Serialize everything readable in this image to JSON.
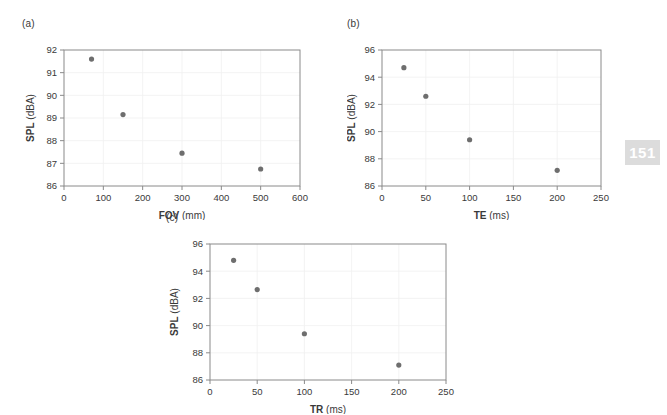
{
  "page_number": "151",
  "page_number_bg": "#dcdcdc",
  "marker_color": "#6e6e6e",
  "frame_color": "#8a8a8a",
  "grid_color": "#f0f0f0",
  "chart_data": [
    {
      "type": "scatter",
      "panel_label": "(a)",
      "title": "",
      "xlabel_bold": "FOV",
      "xlabel_unit": "(mm)",
      "ylabel_bold": "SPL",
      "ylabel_unit": "(dBA)",
      "xlim": [
        0,
        600
      ],
      "ylim": [
        86,
        92
      ],
      "xticks": [
        0,
        100,
        200,
        300,
        400,
        500,
        600
      ],
      "yticks": [
        86,
        87,
        88,
        89,
        90,
        91,
        92
      ],
      "xticklabels": [
        "0",
        "100",
        "200",
        "300",
        "400",
        "500",
        "600"
      ],
      "yticklabels": [
        "86",
        "87",
        "88",
        "89",
        "90",
        "91",
        "92"
      ],
      "grid": true,
      "legend": "none",
      "x": [
        70,
        150,
        300,
        500
      ],
      "y": [
        91.6,
        89.15,
        87.45,
        86.75
      ]
    },
    {
      "type": "scatter",
      "panel_label": "(b)",
      "title": "",
      "xlabel_bold": "TE",
      "xlabel_unit": "(ms)",
      "ylabel_bold": "SPL",
      "ylabel_unit": "(dBA)",
      "xlim": [
        0,
        250
      ],
      "ylim": [
        86,
        96
      ],
      "xticks": [
        0,
        50,
        100,
        150,
        200,
        250
      ],
      "yticks": [
        86,
        88,
        90,
        92,
        94,
        96
      ],
      "xticklabels": [
        "0",
        "50",
        "100",
        "150",
        "200",
        "250"
      ],
      "yticklabels": [
        "86",
        "88",
        "90",
        "92",
        "94",
        "96"
      ],
      "grid": true,
      "legend": "none",
      "x": [
        25,
        50,
        100,
        200
      ],
      "y": [
        94.7,
        92.6,
        89.4,
        87.15
      ]
    },
    {
      "type": "scatter",
      "panel_label": "(c)",
      "title": "",
      "xlabel_bold": "TR",
      "xlabel_unit": "(ms)",
      "ylabel_bold": "SPL",
      "ylabel_unit": "(dBA)",
      "xlim": [
        0,
        250
      ],
      "ylim": [
        86,
        96
      ],
      "xticks": [
        0,
        50,
        100,
        150,
        200,
        250
      ],
      "yticks": [
        86,
        88,
        90,
        92,
        94,
        96
      ],
      "xticklabels": [
        "0",
        "50",
        "100",
        "150",
        "200",
        "250"
      ],
      "yticklabels": [
        "86",
        "88",
        "90",
        "92",
        "94",
        "96"
      ],
      "grid": true,
      "legend": "none",
      "x": [
        25,
        50,
        100,
        200
      ],
      "y": [
        94.8,
        92.65,
        89.4,
        87.1
      ]
    }
  ]
}
